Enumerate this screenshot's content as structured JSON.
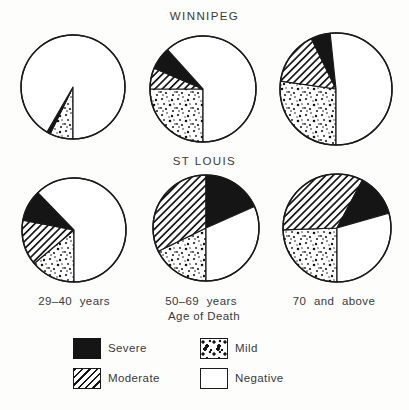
{
  "titles": {
    "winnipeg": "WINNIPEG",
    "st_louis": "ST LOUIS"
  },
  "axis": {
    "xlabel": "Age of Death",
    "categories": [
      "29–40 years",
      "50–69 years",
      "70 and above"
    ]
  },
  "colors": {
    "ink": "#1a1a1a",
    "fill_black": "#151515",
    "paper": "#fdfdfc"
  },
  "legend": {
    "items": [
      {
        "label": "Severe",
        "pattern": "solid-black"
      },
      {
        "label": "Moderate",
        "pattern": "diagonal-hatch"
      },
      {
        "label": "Mild",
        "pattern": "stipple-dots"
      },
      {
        "label": "Negative",
        "pattern": "white"
      }
    ]
  },
  "pies": [
    {
      "id": "winnipeg-29-40",
      "city": "WINNIPEG",
      "age_group": "29–40 years",
      "cx": 73,
      "cy": 87,
      "r": 52,
      "start_deg": 180,
      "slices": [
        {
          "severity": "Mild",
          "degrees": 26,
          "percent": 7
        },
        {
          "severity": "Moderate",
          "degrees": 0,
          "percent": 0
        },
        {
          "severity": "Severe",
          "degrees": 4,
          "percent": 1
        },
        {
          "severity": "Negative",
          "degrees": 330,
          "percent": 92
        }
      ]
    },
    {
      "id": "winnipeg-50-69",
      "city": "WINNIPEG",
      "age_group": "50–69 years",
      "cx": 203,
      "cy": 89,
      "r": 53,
      "start_deg": 180,
      "slices": [
        {
          "severity": "Mild",
          "degrees": 90,
          "percent": 25
        },
        {
          "severity": "Moderate",
          "degrees": 23,
          "percent": 6
        },
        {
          "severity": "Severe",
          "degrees": 25,
          "percent": 7
        },
        {
          "severity": "Negative",
          "degrees": 222,
          "percent": 62
        }
      ]
    },
    {
      "id": "winnipeg-70-above",
      "city": "WINNIPEG",
      "age_group": "70 and above",
      "cx": 336,
      "cy": 89,
      "r": 56,
      "start_deg": 180,
      "slices": [
        {
          "severity": "Mild",
          "degrees": 98,
          "percent": 27
        },
        {
          "severity": "Moderate",
          "degrees": 56,
          "percent": 16
        },
        {
          "severity": "Severe",
          "degrees": 20,
          "percent": 6
        },
        {
          "severity": "Negative",
          "degrees": 186,
          "percent": 51
        }
      ]
    },
    {
      "id": "stlouis-29-40",
      "city": "ST LOUIS",
      "age_group": "29–40 years",
      "cx": 74,
      "cy": 230,
      "r": 52,
      "start_deg": 180,
      "slices": [
        {
          "severity": "Mild",
          "degrees": 50,
          "percent": 14
        },
        {
          "severity": "Moderate",
          "degrees": 51,
          "percent": 14
        },
        {
          "severity": "Severe",
          "degrees": 35,
          "percent": 10
        },
        {
          "severity": "Negative",
          "degrees": 224,
          "percent": 62
        }
      ]
    },
    {
      "id": "stlouis-50-69",
      "city": "ST LOUIS",
      "age_group": "50–69 years",
      "cx": 206,
      "cy": 228,
      "r": 53,
      "start_deg": 180,
      "slices": [
        {
          "severity": "Mild",
          "degrees": 64,
          "percent": 18
        },
        {
          "severity": "Moderate",
          "degrees": 116,
          "percent": 32
        },
        {
          "severity": "Severe",
          "degrees": 66,
          "percent": 18
        },
        {
          "severity": "Negative",
          "degrees": 114,
          "percent": 32
        }
      ]
    },
    {
      "id": "stlouis-70-above",
      "city": "ST LOUIS",
      "age_group": "70 and above",
      "cx": 337,
      "cy": 228,
      "r": 54,
      "start_deg": 180,
      "slices": [
        {
          "severity": "Mild",
          "degrees": 88,
          "percent": 24
        },
        {
          "severity": "Moderate",
          "degrees": 120,
          "percent": 33
        },
        {
          "severity": "Severe",
          "degrees": 46,
          "percent": 13
        },
        {
          "severity": "Negative",
          "degrees": 106,
          "percent": 30
        }
      ]
    }
  ],
  "chart_data": [
    {
      "type": "pie",
      "title": "WINNIPEG — 29–40 years",
      "labels": [
        "Mild",
        "Moderate",
        "Severe",
        "Negative"
      ],
      "values_percent": [
        7,
        0,
        1,
        92
      ]
    },
    {
      "type": "pie",
      "title": "WINNIPEG — 50–69 years",
      "labels": [
        "Mild",
        "Moderate",
        "Severe",
        "Negative"
      ],
      "values_percent": [
        25,
        6,
        7,
        62
      ]
    },
    {
      "type": "pie",
      "title": "WINNIPEG — 70 and above",
      "labels": [
        "Mild",
        "Moderate",
        "Severe",
        "Negative"
      ],
      "values_percent": [
        27,
        16,
        6,
        51
      ]
    },
    {
      "type": "pie",
      "title": "ST LOUIS — 29–40 years",
      "labels": [
        "Mild",
        "Moderate",
        "Severe",
        "Negative"
      ],
      "values_percent": [
        14,
        14,
        10,
        62
      ]
    },
    {
      "type": "pie",
      "title": "ST LOUIS — 50–69 years",
      "labels": [
        "Mild",
        "Moderate",
        "Severe",
        "Negative"
      ],
      "values_percent": [
        18,
        32,
        18,
        32
      ]
    },
    {
      "type": "pie",
      "title": "ST LOUIS — 70 and above",
      "labels": [
        "Mild",
        "Moderate",
        "Severe",
        "Negative"
      ],
      "values_percent": [
        24,
        33,
        13,
        30
      ]
    }
  ]
}
